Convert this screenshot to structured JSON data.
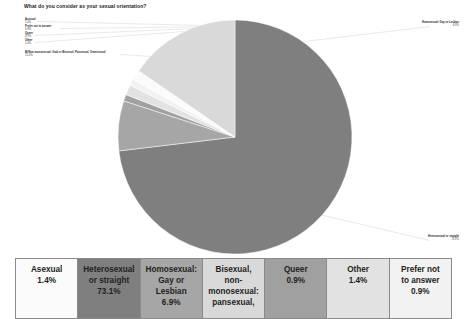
{
  "chart_title": "What do you consider as your sexual orientation?",
  "chart_data": {
    "type": "pie",
    "title": "What do you consider as your sexual orientation?",
    "legend_position": "bottom-table",
    "unit": "percent",
    "categories": [
      "Asexual",
      "Heterosexual or straight",
      "Homosexual: Gay or Lesbian",
      "Bisexual, non-monosexual: pansexual, fluid",
      "Queer",
      "Other",
      "Prefer not to answer"
    ],
    "values": [
      1.4,
      73.1,
      6.9,
      15.4,
      0.9,
      1.4,
      0.9
    ],
    "colors": [
      "#fbfbfb",
      "#7f7f7f",
      "#a6a6a6",
      "#d9d9d9",
      "#a0a0a0",
      "#e2e2e2",
      "#f2f2f2"
    ]
  },
  "callouts": {
    "left": [
      {
        "name": "Asexual",
        "value": "1.4%"
      },
      {
        "name": "Prefer not to answer",
        "value": "0.9%"
      },
      {
        "name": "Queer",
        "value": "0.9%"
      },
      {
        "name": "Other",
        "value": "1.4%"
      },
      {
        "name": "Bi/Non-monosexual: fluid or Bisexual, Pansexual, Omnisexual",
        "value": "15.4%"
      }
    ],
    "right": [
      {
        "name": "Homosexual: Gay or Lesbian",
        "value": "6.9%"
      },
      {
        "name": "Heterosexual or straight",
        "value": "73.1%"
      }
    ]
  },
  "legend": {
    "cells": [
      {
        "lines": [
          "Asexual",
          "1.4%"
        ],
        "color": "#fbfbfb"
      },
      {
        "lines": [
          "Heterosexual",
          "or straight",
          "73.1%"
        ],
        "color": "#7f7f7f"
      },
      {
        "lines": [
          "Homosexual:",
          "Gay or",
          "Lesbian",
          "6.9%"
        ],
        "color": "#a6a6a6"
      },
      {
        "lines": [
          "Bisexual,",
          "non-",
          "monosexual:",
          "pansexual,"
        ],
        "color": "#d9d9d9"
      },
      {
        "lines": [
          "Queer",
          "0.9%"
        ],
        "color": "#a0a0a0"
      },
      {
        "lines": [
          "Other",
          "1.4%"
        ],
        "color": "#e2e2e2"
      },
      {
        "lines": [
          "Prefer not",
          "to answer",
          "0.9%"
        ],
        "color": "#f2f2f2"
      }
    ]
  }
}
